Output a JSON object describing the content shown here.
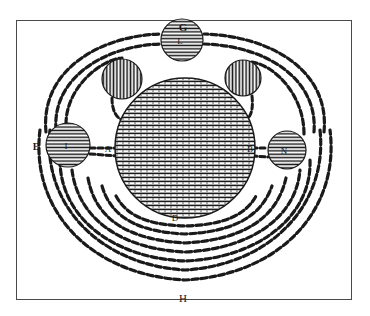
{
  "figure": {
    "frame_color": "#4a4a4a",
    "ink_color": "#1a1a1a",
    "background_color": "#ffffff",
    "labels": {
      "top": "G",
      "left": "E",
      "bottom": "H",
      "below_center": "D",
      "left_inner": "A",
      "right_inner": "B",
      "top_sphere": "L",
      "left_sphere": "I",
      "right_sphere": "N"
    },
    "spheres": [
      {
        "id": "central",
        "cx": 185,
        "cy": 148,
        "r": 70
      },
      {
        "id": "top",
        "label": "L",
        "cx": 182,
        "cy": 40,
        "r": 21
      },
      {
        "id": "upper-left",
        "cx": 122,
        "cy": 79,
        "r": 20
      },
      {
        "id": "upper-right",
        "cx": 243,
        "cy": 78,
        "r": 18
      },
      {
        "id": "left",
        "label": "I",
        "cx": 68,
        "cy": 145,
        "r": 22
      },
      {
        "id": "right",
        "label": "N",
        "cx": 287,
        "cy": 150,
        "r": 19
      }
    ]
  }
}
